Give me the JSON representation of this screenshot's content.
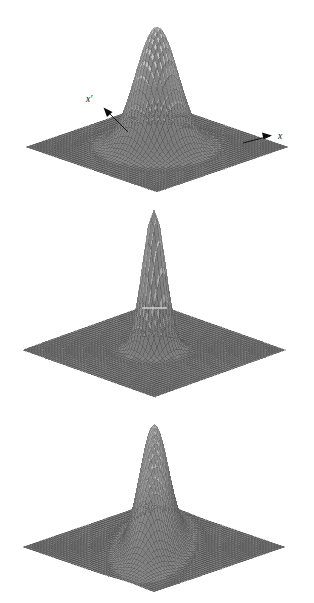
{
  "figure": {
    "caption": "",
    "background_color": "#ffffff",
    "panel_count": 3,
    "width": 314,
    "height": 603
  },
  "annotations": {
    "x_label": "x",
    "x_prime_label": "x′"
  },
  "colors": {
    "mesh_dark": "#4a4a4a",
    "mesh_mid": "#6e6e6e",
    "mesh_light": "#b9b9b9",
    "mesh_highlight": "#e8e8e8",
    "plane_fill": "#6b6b6b",
    "plane_grid": "#3f3f3f",
    "arrow": "#0d0d0d",
    "background": "#ffffff"
  },
  "chart_data": [
    {
      "type": "surface",
      "id": "panel-top",
      "title": "",
      "xlabel": "x",
      "ylabel": "x′",
      "zlabel": "",
      "description": "Isotropic Gaussian peak on a flat square base plane, viewed in 3D oblique projection. Arrows label the x axis (pointing right) and the x′ axis (pointing up-left).",
      "function": "z = A * exp(-((u^2)/(2*sx^2) + (v^2)/(2*sy^2)))",
      "amplitude": 1.0,
      "sigma_x": 0.115,
      "sigma_y": 0.115,
      "rotation_deg": 0,
      "center": [
        0.5,
        0.5
      ],
      "grid_n": 46,
      "xlim": [
        0,
        1
      ],
      "ylim": [
        0,
        1
      ],
      "zlim": [
        0,
        1
      ],
      "peak_height_px": 120,
      "grid": true,
      "legend": "none",
      "annotations": [
        {
          "text": "x",
          "type": "axis-arrow",
          "direction": "right"
        },
        {
          "text": "x′",
          "type": "axis-arrow",
          "direction": "up-left"
        }
      ]
    },
    {
      "type": "surface",
      "id": "panel-middle",
      "title": "",
      "xlabel": "",
      "ylabel": "",
      "zlabel": "",
      "description": "Narrow, taller Gaussian spike on the same flat base plane. A thin white horizontal scan artifact crosses the peak.",
      "function": "z = A * exp(-((u^2)/(2*sx^2) + (v^2)/(2*sy^2)))",
      "amplitude": 1.0,
      "sigma_x": 0.062,
      "sigma_y": 0.062,
      "rotation_deg": 0,
      "center": [
        0.5,
        0.5
      ],
      "grid_n": 46,
      "xlim": [
        0,
        1
      ],
      "ylim": [
        0,
        1
      ],
      "zlim": [
        0,
        1
      ],
      "peak_height_px": 140,
      "grid": true,
      "legend": "none",
      "annotations": [
        {
          "text": "",
          "type": "scan-line",
          "y_fraction": 0.5
        }
      ]
    },
    {
      "type": "surface",
      "id": "panel-bottom",
      "title": "",
      "xlabel": "",
      "ylabel": "",
      "zlabel": "",
      "description": "Anisotropic Gaussian ridge, elongated and rotated relative to the axes, on the same flat base plane; the skirt sweeps toward the lower-left.",
      "function": "z = A * exp(-((u'^2)/(2*sx^2) + (v'^2)/(2*sy^2))) with (u',v') rotated",
      "amplitude": 1.0,
      "sigma_x": 0.075,
      "sigma_y": 0.2,
      "rotation_deg": 38,
      "center": [
        0.5,
        0.5
      ],
      "grid_n": 46,
      "xlim": [
        0,
        1
      ],
      "ylim": [
        0,
        1
      ],
      "zlim": [
        0,
        1
      ],
      "peak_height_px": 122,
      "grid": true,
      "legend": "none",
      "annotations": []
    }
  ]
}
